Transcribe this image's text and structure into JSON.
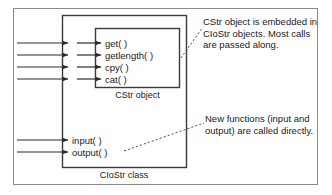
{
  "diagram": {
    "outer_box": {
      "name": "CIoStr class",
      "caption": "CIoStr class"
    },
    "inner_box": {
      "name": "CStr object",
      "caption": "CStr object"
    },
    "passthrough_methods": [
      {
        "label": "get( )"
      },
      {
        "label": "getlength( )"
      },
      {
        "label": "cpy( )"
      },
      {
        "label": "cat( )"
      }
    ],
    "direct_methods": [
      {
        "label": "input( )"
      },
      {
        "label": "output( )"
      }
    ],
    "annotations": [
      {
        "id": "embedded-note",
        "text": "CStr object is embedded in CIoStr objects. Most calls are passed along."
      },
      {
        "id": "direct-note",
        "text": "New functions (input and output) are called directly."
      }
    ],
    "colors": {
      "frame": "#8a8a8a",
      "box_stroke": "#3a3a3a",
      "arrow": "#2b2b2b",
      "leader": "#4a4a4a",
      "text": "#1a1a1a",
      "background": "#ffffff"
    }
  }
}
